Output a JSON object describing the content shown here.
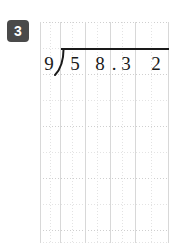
{
  "worksheet": {
    "problem_number": "3",
    "badge_color": "#4a4a4a",
    "badge_text_color": "#ffffff",
    "ink_color": "#1a1a1a",
    "paper_color": "#ffffff",
    "grid_line_color": "#d8d8d8",
    "grid_dotted_color": "#e3e3e3"
  },
  "problem": {
    "type": "long-division",
    "divisor": "9",
    "dividend": "58.32",
    "dividend_digits": [
      "5",
      "8",
      "3",
      "2"
    ],
    "decimal_point": ".",
    "decimal_position_after_digit": 2,
    "quotient": "",
    "bracket_icon": "division-bracket-icon",
    "expression_text": "9)58.32"
  },
  "grid": {
    "columns": 5,
    "rows": 8,
    "has_dotted_subgrid": true,
    "solid_vertical_x": [
      0,
      20,
      45,
      70,
      95,
      128
    ],
    "dotted_vertical_x": [
      10,
      32,
      57,
      82,
      111
    ],
    "solid_horizontal_y": [],
    "dotted_horizontal_y": [
      0,
      26,
      52,
      78,
      104,
      130,
      156,
      182,
      208,
      220
    ]
  }
}
